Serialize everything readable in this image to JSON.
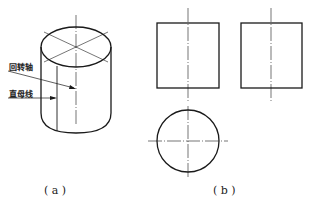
{
  "figure_a": {
    "caption": "( a )",
    "labels": {
      "axis_of_revolution": "回转轴",
      "straight_generatrix": "直母线"
    }
  },
  "figure_b": {
    "caption": "( b )"
  },
  "colors": {
    "line": "#1a1a1a",
    "background": "#ffffff"
  }
}
